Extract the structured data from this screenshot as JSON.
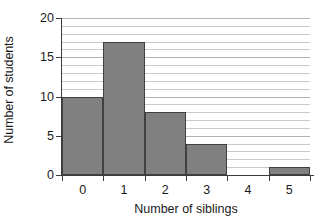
{
  "chart_data": {
    "type": "bar",
    "title": "",
    "subtitle": "",
    "xlabel": "Number of siblings",
    "ylabel": "Number of students",
    "categories": [
      "0",
      "1",
      "2",
      "3",
      "4",
      "5"
    ],
    "values": [
      10,
      17,
      8,
      4,
      0,
      1
    ],
    "series": [
      {
        "name": "Number of students",
        "values": [
          10,
          17,
          8,
          4,
          0,
          1
        ]
      }
    ],
    "ylim": [
      0,
      20
    ],
    "xlim": [
      -0.5,
      5.5
    ],
    "ytick_labels": [
      "0",
      "5",
      "10",
      "15",
      "20"
    ],
    "ytick_values": [
      0,
      5,
      10,
      15,
      20
    ],
    "xtick_labels": [
      "0",
      "1",
      "2",
      "3",
      "4",
      "5"
    ],
    "gridlines": {
      "horizontal": true,
      "vertical": false,
      "interval": 1,
      "minor_values": [
        1,
        2,
        3,
        4,
        6,
        7,
        8,
        9,
        11,
        12,
        13,
        14,
        16,
        17,
        18,
        19
      ],
      "major_values": [
        5,
        10,
        15,
        20
      ]
    },
    "legend": {
      "visible": false,
      "position": "none",
      "entries": []
    },
    "annotations": [],
    "colors": {
      "bar_fill": "#808080",
      "bar_border": "#404040",
      "gridline": "#c9c9c9",
      "gridline_major": "#b4b4b4",
      "axis": "#3c3c3c",
      "text": "#1a1a1a",
      "background": "#ffffff"
    },
    "style": {
      "bar_gap": 0,
      "bar_style": "histogram-adjacent"
    }
  }
}
